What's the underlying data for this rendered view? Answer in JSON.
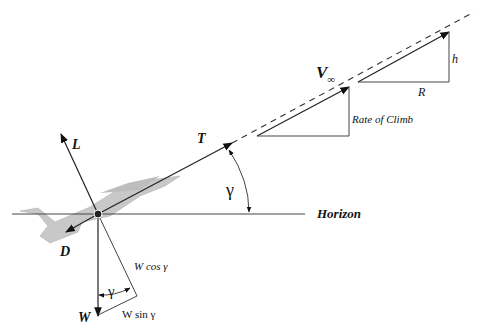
{
  "diagram": {
    "labels": {
      "lift": "L",
      "drag": "D",
      "thrust": "T",
      "weight": "W",
      "velocity": "V",
      "velocity_subscript": "∞",
      "climb_angle": "γ",
      "angle_at_weight": "γ",
      "horizon": "Horizon",
      "rate_of_climb": "Rate of Climb",
      "w_cos": "W cos γ",
      "w_sin": "W sin γ",
      "h": "h",
      "r": "R"
    },
    "colors": {
      "ink": "#222222",
      "aircraft": "#c8c8c8",
      "background": "#ffffff"
    }
  }
}
